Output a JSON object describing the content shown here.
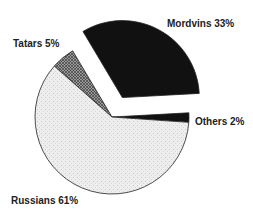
{
  "chart_data": {
    "type": "pie",
    "title": "",
    "categories": [
      "Others",
      "Mordvins",
      "Tatars",
      "Russians"
    ],
    "values": [
      2,
      33,
      5,
      61
    ],
    "unit": "%",
    "labels": [
      "Others 2%",
      "Mordvins 33%",
      "Tatars 5%",
      "Russians 61%"
    ],
    "exploded": [
      "Mordvins"
    ],
    "legend": "none (direct labels)",
    "fills": {
      "Others": "#111111",
      "Mordvins": "#111111",
      "Tatars": "crosshatch-gray",
      "Russians": "#eeeeee"
    }
  },
  "labels": {
    "mordvins": "Mordvins 33%",
    "tatars": "Tatars 5%",
    "others": "Others 2%",
    "russians": "Russians 61%"
  }
}
